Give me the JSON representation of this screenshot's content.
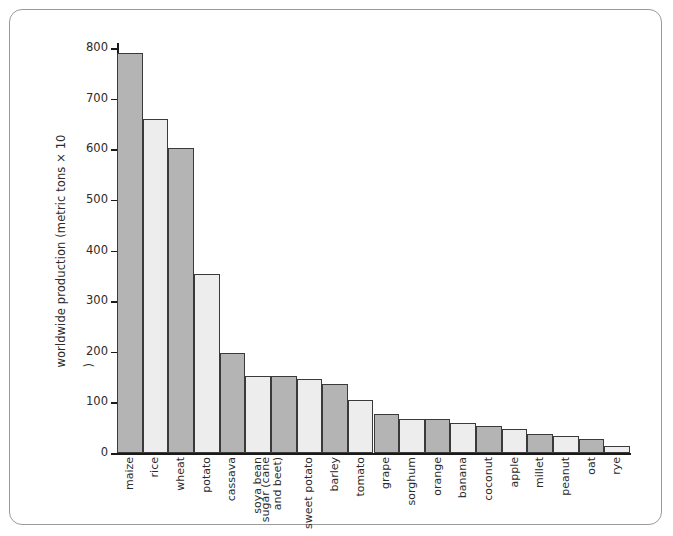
{
  "figure": {
    "frame_color": "#9a9a9a",
    "background": "#ffffff"
  },
  "chart_data": {
    "type": "bar",
    "title": "",
    "xlabel": "",
    "ylabel": "worldwide production (metric tons × 10⁶)",
    "ylim": [
      0,
      800
    ],
    "ytick_step": 100,
    "yticks": [
      0,
      100,
      200,
      300,
      400,
      500,
      600,
      700,
      800
    ],
    "ytick_labels": [
      "0",
      "100",
      "200",
      "300",
      "400",
      "500",
      "600",
      "700",
      "800"
    ],
    "grid": false,
    "legend": "none",
    "bar_colors": {
      "dark": "#b4b4b4",
      "light": "#ededed",
      "edge": "#3a3a3a"
    },
    "categories": [
      "maize",
      "rice",
      "wheat",
      "potato",
      "cassava",
      "soya bean",
      "sugar (cane\nand beet)",
      "sweet potato",
      "barley",
      "tomato",
      "grape",
      "sorghum",
      "orange",
      "banana",
      "coconut",
      "apple",
      "millet",
      "peanut",
      "oat",
      "rye"
    ],
    "values": [
      790,
      660,
      603,
      353,
      197,
      153,
      153,
      147,
      137,
      104,
      78,
      68,
      68,
      59,
      53,
      47,
      38,
      33,
      28,
      14
    ],
    "shades": [
      "dark",
      "light",
      "dark",
      "light",
      "dark",
      "light",
      "dark",
      "light",
      "dark",
      "light",
      "dark",
      "light",
      "dark",
      "light",
      "dark",
      "light",
      "dark",
      "light",
      "dark",
      "light"
    ]
  }
}
